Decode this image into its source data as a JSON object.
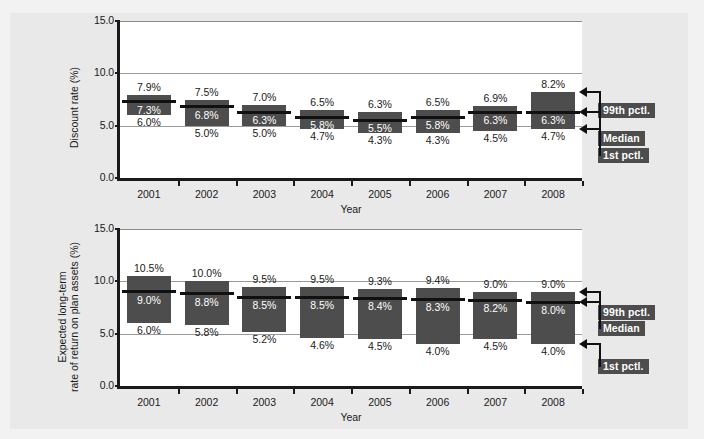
{
  "figure": {
    "background_color": "#e9e9e9",
    "plot_background_color": "#ffffff",
    "bar_color": "#4d4d4d",
    "median_color": "#111111",
    "grid_color": "#9a9a9a"
  },
  "annotations": {
    "p99_label": "99th pctl.",
    "median_label": "Median",
    "p1_label": "1st pctl."
  },
  "chart_data": [
    {
      "id": "discount-rate",
      "type": "bar",
      "title": "",
      "xlabel": "Year",
      "ylabel": "Discount rate (%)",
      "ylim": [
        0.0,
        15.0
      ],
      "yticks": [
        "0.0",
        "5.0",
        "10.0",
        "15.0"
      ],
      "ytick_values": [
        0.0,
        5.0,
        10.0,
        15.0
      ],
      "grid": true,
      "legend_position": "right-annotations",
      "categories": [
        "2001",
        "2002",
        "2003",
        "2004",
        "2005",
        "2006",
        "2007",
        "2008"
      ],
      "series": [
        {
          "name": "99th pctl.",
          "values": [
            7.9,
            7.5,
            7.0,
            6.5,
            6.3,
            6.5,
            6.9,
            8.2
          ],
          "labels": [
            "7.9%",
            "7.5%",
            "7.0%",
            "6.5%",
            "6.3%",
            "6.5%",
            "6.9%",
            "8.2%"
          ]
        },
        {
          "name": "Median",
          "values": [
            7.3,
            6.8,
            6.3,
            5.8,
            5.5,
            5.8,
            6.3,
            6.3
          ],
          "labels": [
            "7.3%",
            "6.8%",
            "6.3%",
            "5.8%",
            "5.5%",
            "5.8%",
            "6.3%",
            "6.3%"
          ]
        },
        {
          "name": "1st pctl.",
          "values": [
            6.0,
            5.0,
            5.0,
            4.7,
            4.3,
            4.3,
            4.5,
            4.7
          ],
          "labels": [
            "6.0%",
            "5.0%",
            "5.0%",
            "4.7%",
            "4.3%",
            "4.3%",
            "4.5%",
            "4.7%"
          ]
        }
      ]
    },
    {
      "id": "expected-return",
      "type": "bar",
      "title": "",
      "xlabel": "Year",
      "ylabel_line1": "Expected long-term",
      "ylabel_line2": "rate of return on plan assets (%)",
      "ylabel": "Expected long-term rate of return on plan assets (%)",
      "ylim": [
        0.0,
        15.0
      ],
      "yticks": [
        "0.0",
        "5.0",
        "10.0",
        "15.0"
      ],
      "ytick_values": [
        0.0,
        5.0,
        10.0,
        15.0
      ],
      "grid": true,
      "legend_position": "right-annotations",
      "categories": [
        "2001",
        "2002",
        "2003",
        "2004",
        "2005",
        "2006",
        "2007",
        "2008"
      ],
      "series": [
        {
          "name": "99th pctl.",
          "values": [
            10.5,
            10.0,
            9.5,
            9.5,
            9.3,
            9.4,
            9.0,
            9.0
          ],
          "labels": [
            "10.5%",
            "10.0%",
            "9.5%",
            "9.5%",
            "9.3%",
            "9.4%",
            "9.0%",
            "9.0%"
          ]
        },
        {
          "name": "Median",
          "values": [
            9.0,
            8.8,
            8.5,
            8.5,
            8.4,
            8.3,
            8.2,
            8.0
          ],
          "labels": [
            "9.0%",
            "8.8%",
            "8.5%",
            "8.5%",
            "8.4%",
            "8.3%",
            "8.2%",
            "8.0%"
          ]
        },
        {
          "name": "1st pctl.",
          "values": [
            6.0,
            5.8,
            5.2,
            4.6,
            4.5,
            4.0,
            4.5,
            4.0
          ],
          "labels": [
            "6.0%",
            "5.8%",
            "5.2%",
            "4.6%",
            "4.5%",
            "4.0%",
            "4.5%",
            "4.0%"
          ]
        }
      ]
    }
  ]
}
